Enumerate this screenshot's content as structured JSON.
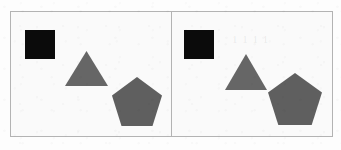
{
  "figure": {
    "background_color": "#fafafa",
    "border_color": "#b3b3b3",
    "canvas": {
      "width": 341,
      "height": 150
    },
    "frame": {
      "x": 10,
      "y": 11,
      "width": 323,
      "height": 126
    }
  },
  "palette": {
    "square_fill": "#0b0b0b",
    "triangle_fill": "#666666",
    "pentagon_fill": "#5f5f5f",
    "page_background": "#fdfdfd",
    "panel_background": "#fafafa",
    "outline": "#b3b3b3"
  },
  "panels": [
    {
      "id": "left",
      "label": "Left panel",
      "shapes": [
        {
          "name": "square",
          "icon": "filled-square-icon",
          "color_label": "black",
          "fill": "#0b0b0b",
          "x": 14,
          "y": 18,
          "width": 30,
          "height": 29
        },
        {
          "name": "triangle",
          "icon": "filled-triangle-icon",
          "color_label": "gray",
          "fill": "#666666",
          "x": 54,
          "y": 39,
          "width": 43,
          "height": 35
        },
        {
          "name": "pentagon",
          "icon": "filled-pentagon-icon",
          "color_label": "gray",
          "fill": "#5f5f5f",
          "x": 101,
          "y": 65,
          "width": 50,
          "height": 49
        }
      ]
    },
    {
      "id": "right",
      "label": "Right panel",
      "shapes": [
        {
          "name": "square",
          "icon": "filled-square-icon",
          "color_label": "black",
          "fill": "#0b0b0b",
          "x": 12,
          "y": 18,
          "width": 30,
          "height": 29
        },
        {
          "name": "triangle",
          "icon": "filled-triangle-icon",
          "color_label": "gray",
          "fill": "#666666",
          "x": 53,
          "y": 42,
          "width": 42,
          "height": 36
        },
        {
          "name": "pentagon",
          "icon": "filled-pentagon-icon",
          "color_label": "gray",
          "fill": "#5f5f5f",
          "x": 96,
          "y": 61,
          "width": 54,
          "height": 52
        }
      ],
      "watermark": {
        "text": "1 1 1 1",
        "x": 60,
        "y": 21
      }
    }
  ]
}
